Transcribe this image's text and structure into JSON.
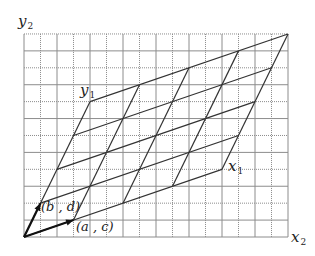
{
  "diagram": {
    "title": "",
    "grid": {
      "cols": 16,
      "rows": 12,
      "origin_px": [
        24,
        237
      ],
      "cell_w": 16.5,
      "cell_h": 16.92,
      "color": "#8c8c8c"
    },
    "axes": {
      "x": {
        "name": "x",
        "sub": "2"
      },
      "y": {
        "name": "y",
        "sub": "2"
      }
    },
    "basis_vectors": [
      {
        "id": "a_c",
        "label": "(a , c)",
        "coords": [
          3,
          1
        ]
      },
      {
        "id": "b_d",
        "label": "(b , d)",
        "coords": [
          1,
          2
        ]
      }
    ],
    "lattice": {
      "steps": 4,
      "line_color": "#333333"
    },
    "new_axes": {
      "x1": {
        "name": "x",
        "sub": "1",
        "at": [
          12,
          4
        ]
      },
      "y1": {
        "name": "y",
        "sub": "1",
        "at": [
          4,
          8
        ]
      }
    }
  }
}
